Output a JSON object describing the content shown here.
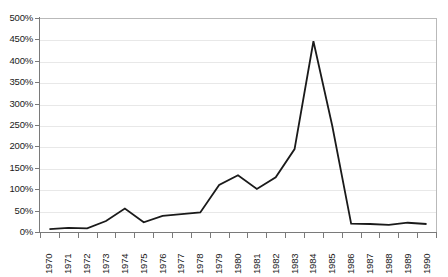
{
  "chart_data": {
    "type": "line",
    "title": "",
    "subtitle": "",
    "xlabel": "",
    "ylabel": "",
    "grid": true,
    "legend": false,
    "legend_position": "none",
    "ylim": [
      0,
      500
    ],
    "y_tick_step": 50,
    "y_tick_labels": [
      "500%",
      "450%",
      "400%",
      "350%",
      "300%",
      "250%",
      "200%",
      "150%",
      "100%",
      "50%",
      "0%"
    ],
    "y_tick_values": [
      500,
      450,
      400,
      350,
      300,
      250,
      200,
      150,
      100,
      50,
      0
    ],
    "value_suffix": "%",
    "categories": [
      "1970",
      "1971",
      "1972",
      "1973",
      "1974",
      "1975",
      "1976",
      "1977",
      "1978",
      "1979",
      "1980",
      "1981",
      "1982",
      "1983",
      "1984",
      "1985",
      "1986",
      "1987",
      "1988",
      "1989",
      "1990"
    ],
    "x": [
      1970,
      1971,
      1972,
      1973,
      1974,
      1975,
      1976,
      1977,
      1978,
      1979,
      1980,
      1981,
      1982,
      1983,
      1984,
      1985,
      1986,
      1987,
      1988,
      1989,
      1990
    ],
    "values": [
      9,
      12,
      11,
      28,
      57,
      25,
      40,
      44,
      48,
      112,
      135,
      103,
      130,
      196,
      448,
      250,
      22,
      21,
      19,
      24,
      21
    ],
    "series": [
      {
        "name": "",
        "color": "#1a1a1a",
        "line_width": 1.8,
        "markers": false,
        "values": [
          9,
          12,
          11,
          28,
          57,
          25,
          40,
          44,
          48,
          112,
          135,
          103,
          130,
          196,
          448,
          250,
          22,
          21,
          19,
          24,
          21
        ]
      }
    ],
    "colors": {
      "line": "#1a1a1a",
      "grid": "#e8e8e8",
      "axis": "#7a7a7a",
      "plot_border": "#b9b9b9",
      "background": "#ffffff",
      "text": "#1a1a1a"
    }
  }
}
